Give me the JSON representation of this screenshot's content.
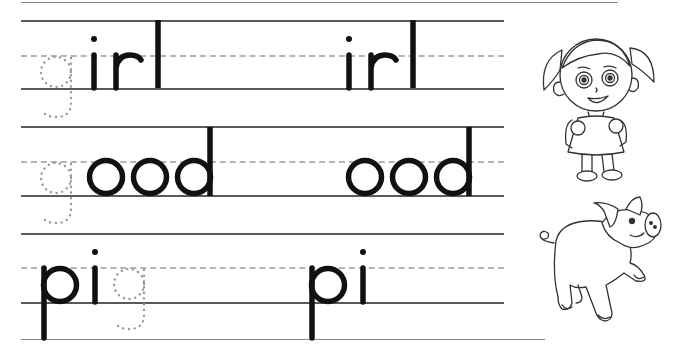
{
  "worksheet": {
    "rows": [
      {
        "traced_letter": "g",
        "traced_position": "start",
        "word_1": "irl",
        "word_2": "irl",
        "full_word": "girl"
      },
      {
        "traced_letter": "g",
        "traced_position": "start",
        "word_1": "ood",
        "word_2": "ood",
        "full_word": "good"
      },
      {
        "traced_letter": "g",
        "traced_position": "end",
        "word_1": "pi",
        "word_2": "pi",
        "full_word": "pig"
      }
    ],
    "illustrations": [
      {
        "name": "girl",
        "description": "cartoon girl with pigtails and backpack, line art"
      },
      {
        "name": "pig",
        "description": "cartoon pig walking, line art"
      }
    ],
    "colors": {
      "ink": "#111111",
      "guide_line": "#5a5a5a",
      "dashed_midline": "#b4b4b4",
      "trace_dots": "#999999"
    }
  }
}
